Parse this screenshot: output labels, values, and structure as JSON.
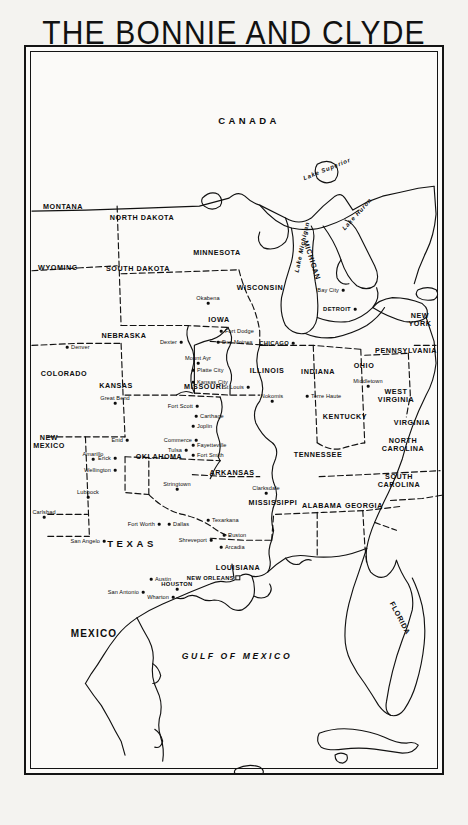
{
  "title": {
    "line1": "THE BONNIE AND CLYDE",
    "line2": "COUNTRY"
  },
  "scale": {
    "miles_caption": "Miles",
    "km_caption": "Kilometres",
    "miles_ticks": [
      "0",
      "100",
      "200",
      "300"
    ],
    "km_ticks": [
      "0",
      "160",
      "320",
      "480"
    ]
  },
  "compass": {
    "north_letter": "N"
  },
  "countries": [
    {
      "name": "CANADA",
      "x": 247,
      "y": 118,
      "cls": "country"
    },
    {
      "name": "MEXICO",
      "x": 92,
      "y": 631,
      "cls": "country mex"
    }
  ],
  "water_labels": [
    {
      "name": "Lake Superior",
      "x": 325,
      "y": 167,
      "rot": -22
    },
    {
      "name": "Lake Michigan",
      "x": 300,
      "y": 245,
      "rot": -78
    },
    {
      "name": "Lake Huron",
      "x": 355,
      "y": 212,
      "rot": -48
    },
    {
      "name": "GULF OF MEXICO",
      "x": 235,
      "y": 654,
      "rot": 0,
      "cls": "gulf"
    }
  ],
  "states": [
    {
      "name": "MONTANA",
      "x": 61,
      "y": 204
    },
    {
      "name": "WYOMING",
      "x": 56,
      "y": 265
    },
    {
      "name": "NORTH DAKOTA",
      "x": 140,
      "y": 215
    },
    {
      "name": "SOUTH DAKOTA",
      "x": 136,
      "y": 266
    },
    {
      "name": "MINNESOTA",
      "x": 215,
      "y": 250
    },
    {
      "name": "WISCONSIN",
      "x": 258,
      "y": 285
    },
    {
      "name": "NEBRASKA",
      "x": 122,
      "y": 333
    },
    {
      "name": "COLORADO",
      "x": 62,
      "y": 371
    },
    {
      "name": "IOWA",
      "x": 217,
      "y": 317
    },
    {
      "name": "KANSAS",
      "x": 114,
      "y": 383
    },
    {
      "name": "MISSOURI",
      "x": 202,
      "y": 384
    },
    {
      "name": "ILLINOIS",
      "x": 265,
      "y": 368
    },
    {
      "name": "INDIANA",
      "x": 316,
      "y": 369
    },
    {
      "name": "OHIO",
      "x": 362,
      "y": 363
    },
    {
      "name": "MICHIGAN",
      "x": 310,
      "y": 258,
      "rot": 72
    },
    {
      "name": "NEW\nYORK",
      "x": 418,
      "y": 318,
      "two": true
    },
    {
      "name": "PENNSYLVANIA",
      "x": 404,
      "y": 348
    },
    {
      "name": "WEST\nVIRGINIA",
      "x": 394,
      "y": 394,
      "two": true
    },
    {
      "name": "VIRGINIA",
      "x": 410,
      "y": 420
    },
    {
      "name": "KENTUCKY",
      "x": 343,
      "y": 414
    },
    {
      "name": "TENNESSEE",
      "x": 316,
      "y": 452
    },
    {
      "name": "NORTH\nCAROLINA",
      "x": 401,
      "y": 443,
      "two": true
    },
    {
      "name": "SOUTH\nCAROLINA",
      "x": 397,
      "y": 479,
      "two": true
    },
    {
      "name": "GEORGIA",
      "x": 362,
      "y": 503
    },
    {
      "name": "ALABAMA",
      "x": 320,
      "y": 503
    },
    {
      "name": "MISSISSIPPI",
      "x": 271,
      "y": 500
    },
    {
      "name": "ARKANSAS",
      "x": 230,
      "y": 470
    },
    {
      "name": "OKLAHOMA",
      "x": 157,
      "y": 454
    },
    {
      "name": "NEW\nMEXICO",
      "x": 47,
      "y": 440,
      "two": true
    },
    {
      "name": "LOUISIANA",
      "x": 236,
      "y": 565
    },
    {
      "name": "FLORIDA",
      "x": 398,
      "y": 616,
      "rot": 62
    },
    {
      "name": "TEXAS",
      "x": 130,
      "y": 541,
      "cls": "texasbig"
    }
  ],
  "cities": [
    {
      "name": "Denver",
      "x": 65,
      "y": 345,
      "align": "right"
    },
    {
      "name": "Okabena",
      "x": 206,
      "y": 296,
      "align": "center-below"
    },
    {
      "name": "Fort Dodge",
      "x": 219,
      "y": 329,
      "align": "right"
    },
    {
      "name": "Dexter",
      "x": 179,
      "y": 340,
      "align": "left"
    },
    {
      "name": "Des Moines",
      "x": 216,
      "y": 340,
      "align": "right"
    },
    {
      "name": "Mount Ayr",
      "x": 196,
      "y": 356,
      "align": "center-below"
    },
    {
      "name": "CHICAGO",
      "x": 291,
      "y": 341,
      "align": "left",
      "major": true
    },
    {
      "name": "DETROIT",
      "x": 353,
      "y": 307,
      "align": "left",
      "major": true
    },
    {
      "name": "Bay City",
      "x": 341,
      "y": 288,
      "align": "left"
    },
    {
      "name": "Middletown",
      "x": 366,
      "y": 379,
      "align": "center-below"
    },
    {
      "name": "Terre Haute",
      "x": 305,
      "y": 394,
      "align": "right"
    },
    {
      "name": "Nokomis",
      "x": 270,
      "y": 394,
      "align": "center-below"
    },
    {
      "name": "Platte City",
      "x": 191,
      "y": 368,
      "align": "right"
    },
    {
      "name": "Kansas City",
      "x": 191,
      "y": 380,
      "align": "right"
    },
    {
      "name": "St Louis",
      "x": 246,
      "y": 385,
      "align": "left"
    },
    {
      "name": "Great Bend",
      "x": 113,
      "y": 396,
      "align": "center-below"
    },
    {
      "name": "Fort Scott",
      "x": 195,
      "y": 404,
      "align": "left"
    },
    {
      "name": "Carthage",
      "x": 194,
      "y": 414,
      "align": "right"
    },
    {
      "name": "Joplin",
      "x": 191,
      "y": 424,
      "align": "right"
    },
    {
      "name": "Fayetteville",
      "x": 191,
      "y": 443,
      "align": "right"
    },
    {
      "name": "Fort Smith",
      "x": 191,
      "y": 453,
      "align": "right"
    },
    {
      "name": "Enid",
      "x": 125,
      "y": 438,
      "align": "left"
    },
    {
      "name": "Commerce",
      "x": 194,
      "y": 438,
      "align": "left"
    },
    {
      "name": "Tulsa",
      "x": 184,
      "y": 448,
      "align": "left"
    },
    {
      "name": "Erick",
      "x": 113,
      "y": 456,
      "align": "left"
    },
    {
      "name": "Amarillo",
      "x": 91,
      "y": 452,
      "align": "center-below"
    },
    {
      "name": "Wellington",
      "x": 113,
      "y": 468,
      "align": "left"
    },
    {
      "name": "Stringtown",
      "x": 175,
      "y": 482,
      "align": "center-below"
    },
    {
      "name": "Lubbock",
      "x": 86,
      "y": 490,
      "align": "center-below"
    },
    {
      "name": "Carlsbad",
      "x": 42,
      "y": 510,
      "align": "center-below"
    },
    {
      "name": "Fort Worth",
      "x": 157,
      "y": 522,
      "align": "left"
    },
    {
      "name": "Dallas",
      "x": 167,
      "y": 522,
      "align": "right"
    },
    {
      "name": "Texarkana",
      "x": 206,
      "y": 518,
      "align": "right"
    },
    {
      "name": "Shreveport",
      "x": 209,
      "y": 538,
      "align": "left"
    },
    {
      "name": "Ruston",
      "x": 222,
      "y": 533,
      "align": "right"
    },
    {
      "name": "Arcadia",
      "x": 219,
      "y": 545,
      "align": "right"
    },
    {
      "name": "Clarksdale",
      "x": 264,
      "y": 486,
      "align": "center-below"
    },
    {
      "name": "San Angelo",
      "x": 102,
      "y": 539,
      "align": "left"
    },
    {
      "name": "Austin",
      "x": 149,
      "y": 577,
      "align": "right"
    },
    {
      "name": "San Antonio",
      "x": 141,
      "y": 590,
      "align": "left"
    },
    {
      "name": "HOUSTON",
      "x": 175,
      "y": 582,
      "align": "center-below",
      "major": true
    },
    {
      "name": "Wharton",
      "x": 171,
      "y": 595,
      "align": "left"
    },
    {
      "name": "NEW ORLEANS",
      "x": 236,
      "y": 576,
      "align": "left",
      "major": true,
      "square": true
    }
  ],
  "colors": {
    "ink": "#0d0d0d",
    "paper": "#fbfaf8",
    "page": "#f4f3f0"
  }
}
